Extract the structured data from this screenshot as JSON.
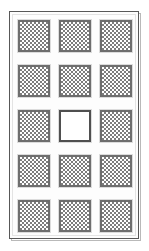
{
  "panel": {
    "title": "Tile Panel",
    "frame_color": "#585858",
    "frame_outer_color": "#b9b9b9",
    "background_color": "#ffffff",
    "inner_liner_color": "#e3e3e3"
  },
  "grid": {
    "rows": 5,
    "columns": 3,
    "tile_border_color": "#6e6e6e",
    "tile_pattern_color": "#7d7d7d",
    "tile_empty_color": "#ffffff",
    "tiles": [
      {
        "row": 1,
        "column": 1,
        "state": "filled",
        "pattern": "checkerboard"
      },
      {
        "row": 1,
        "column": 2,
        "state": "filled",
        "pattern": "checkerboard"
      },
      {
        "row": 1,
        "column": 3,
        "state": "filled",
        "pattern": "checkerboard"
      },
      {
        "row": 2,
        "column": 1,
        "state": "filled",
        "pattern": "checkerboard"
      },
      {
        "row": 2,
        "column": 2,
        "state": "filled",
        "pattern": "checkerboard"
      },
      {
        "row": 2,
        "column": 3,
        "state": "filled",
        "pattern": "checkerboard"
      },
      {
        "row": 3,
        "column": 1,
        "state": "filled",
        "pattern": "checkerboard"
      },
      {
        "row": 3,
        "column": 2,
        "state": "empty",
        "pattern": "none"
      },
      {
        "row": 3,
        "column": 3,
        "state": "filled",
        "pattern": "checkerboard"
      },
      {
        "row": 4,
        "column": 1,
        "state": "filled",
        "pattern": "checkerboard"
      },
      {
        "row": 4,
        "column": 2,
        "state": "filled",
        "pattern": "checkerboard"
      },
      {
        "row": 4,
        "column": 3,
        "state": "filled",
        "pattern": "checkerboard"
      },
      {
        "row": 5,
        "column": 1,
        "state": "filled",
        "pattern": "checkerboard"
      },
      {
        "row": 5,
        "column": 2,
        "state": "filled",
        "pattern": "checkerboard"
      },
      {
        "row": 5,
        "column": 3,
        "state": "filled",
        "pattern": "checkerboard"
      }
    ]
  }
}
